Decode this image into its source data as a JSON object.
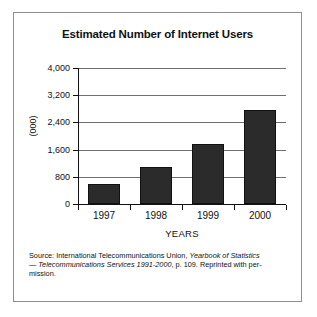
{
  "chart_data": {
    "type": "bar",
    "title": "Estimated Number of Internet Users",
    "xlabel": "YEARS",
    "ylabel": "(000)",
    "categories": [
      "1997",
      "1998",
      "1999",
      "2000"
    ],
    "values": [
      590,
      1100,
      1750,
      2750
    ],
    "ylim": [
      0,
      4000
    ],
    "yticks": [
      0,
      800,
      1600,
      2400,
      3200,
      4000
    ],
    "ytick_labels": [
      "0",
      "800",
      "1,600",
      "2,400",
      "3,200",
      "4,000"
    ],
    "grid": "horizontal",
    "legend": "none",
    "bar_color": "#2b2b2b",
    "axis_color": "#111111",
    "gridline_color": "#6f6f6f"
  },
  "source": {
    "line1_plain": "Source: International Telecommunications Union,  ",
    "line1_italic": "Yearbook of Statistics",
    "line2_dash": "— ",
    "line2_italic": "Telecommunications Services 1991-2000",
    "line2_plain": ", p. 109. Reprinted with per-",
    "line3": "mission."
  },
  "frame": {
    "border_color": "#8e8e8e"
  }
}
